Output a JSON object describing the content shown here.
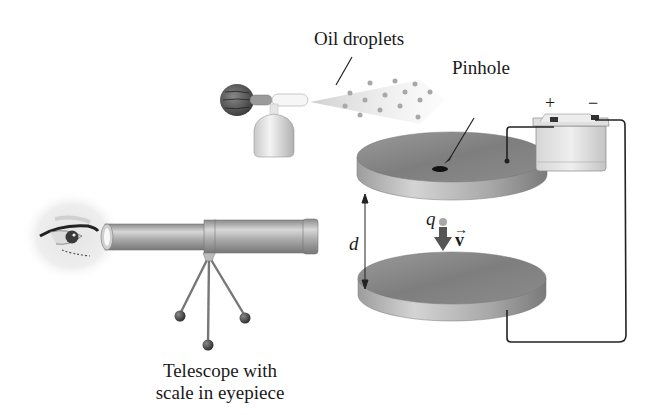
{
  "diagram": {
    "labels": {
      "oil_droplets": "Oil droplets",
      "pinhole": "Pinhole",
      "plus": "+",
      "minus": "−",
      "charge": "q",
      "velocity": "v",
      "velocity_arrow": "→",
      "distance": "d",
      "telescope_line1": "Telescope with",
      "telescope_line2": "scale in eyepiece"
    },
    "components": [
      {
        "name": "atomizer",
        "description": "rubber bulb sprayer producing oil droplets"
      },
      {
        "name": "upper-plate",
        "description": "upper disk plate with pinhole, connected to + terminal"
      },
      {
        "name": "lower-plate",
        "description": "lower disk plate, connected to − terminal"
      },
      {
        "name": "battery",
        "description": "battery with + and − terminals"
      },
      {
        "name": "telescope",
        "description": "telescope on tripod observing droplet"
      },
      {
        "name": "eye",
        "description": "observer's eye at eyepiece"
      },
      {
        "name": "droplet",
        "description": "charged droplet q moving down with velocity v"
      }
    ],
    "colors": {
      "plate": "#8a8a8a",
      "plate_edge": "#b5b5b5",
      "wire": "#222222",
      "droplet": "#9a9a9a",
      "arrow": "#555555"
    }
  }
}
